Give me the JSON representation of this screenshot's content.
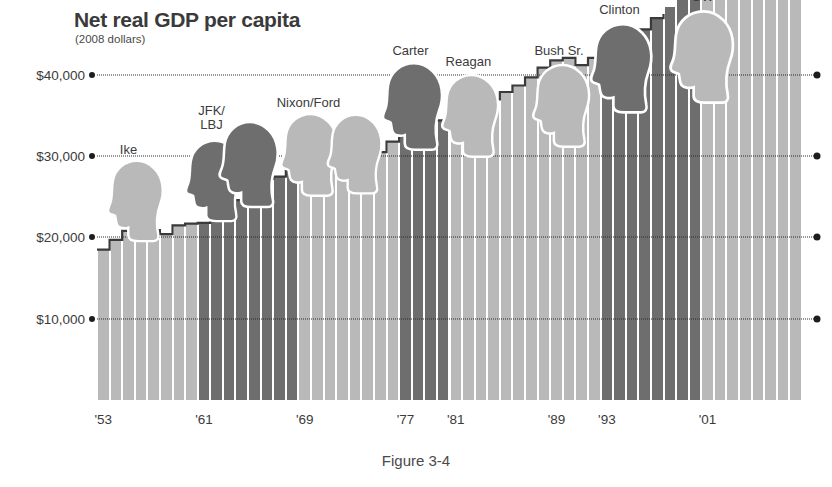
{
  "figure": {
    "caption": "Figure 3-4"
  },
  "header": {
    "title": "Net real GDP per capita",
    "subtitle": "(2008 dollars)"
  },
  "colors": {
    "bar_light": "#b9b9b9",
    "bar_dark": "#6e6e6e",
    "outline": "#3a3a3a",
    "text": "#3b3b3b",
    "grid": "#2a2a2a",
    "background": "#ffffff"
  },
  "chart_data": {
    "type": "bar",
    "title": "Net real GDP per capita",
    "subtitle": "(2008 dollars)",
    "xlabel": "",
    "ylabel": "",
    "ylim": [
      0,
      47500
    ],
    "grid": true,
    "legend": "none",
    "y_ticks": [
      10000,
      20000,
      30000,
      40000
    ],
    "y_tick_labels": [
      "$10,000",
      "$20,000",
      "$30,000",
      "$40,000"
    ],
    "x_tick_years": [
      1953,
      1961,
      1969,
      1977,
      1981,
      1989,
      1993,
      2001
    ],
    "x_tick_labels": [
      "'53",
      "'61",
      "'69",
      "'77",
      "'81",
      "'89",
      "'93",
      "'01"
    ],
    "x": [
      1953,
      1954,
      1955,
      1956,
      1957,
      1958,
      1959,
      1960,
      1961,
      1962,
      1963,
      1964,
      1965,
      1966,
      1967,
      1968,
      1969,
      1970,
      1971,
      1972,
      1973,
      1974,
      1975,
      1976,
      1977,
      1978,
      1979,
      1980,
      1981,
      1982,
      1983,
      1984,
      1985,
      1986,
      1987,
      1988,
      1989,
      1990,
      1991,
      1992,
      1993,
      1994,
      1995,
      1996,
      1997,
      1998,
      1999,
      2000,
      2001,
      2002,
      2003,
      2004,
      2005,
      2006,
      2007,
      2008
    ],
    "values": [
      18500,
      19700,
      20800,
      20900,
      20900,
      20400,
      21500,
      21700,
      21800,
      22800,
      23500,
      24600,
      25900,
      27200,
      27500,
      28500,
      29100,
      28700,
      29200,
      30400,
      31700,
      31100,
      30500,
      31800,
      32900,
      34400,
      35000,
      34400,
      34900,
      33700,
      34900,
      37000,
      37900,
      38700,
      39700,
      40900,
      41800,
      42100,
      41200,
      42100,
      42800,
      44000,
      44500,
      45600,
      47000,
      48400,
      50100,
      51500,
      51300,
      51500,
      52600,
      54200,
      55600,
      56600,
      57000,
      50200
    ],
    "presidents": [
      {
        "label": "Ike",
        "start_year": 1953,
        "end_year": 1960,
        "party": "republican",
        "shade": "light"
      },
      {
        "label": "JFK/\nLBJ",
        "start_year": 1961,
        "end_year": 1968,
        "party": "democrat",
        "shade": "dark"
      },
      {
        "label": "Nixon/Ford",
        "start_year": 1969,
        "end_year": 1976,
        "party": "republican",
        "shade": "light"
      },
      {
        "label": "Carter",
        "start_year": 1977,
        "end_year": 1980,
        "party": "democrat",
        "shade": "dark"
      },
      {
        "label": "Reagan",
        "start_year": 1981,
        "end_year": 1988,
        "party": "republican",
        "shade": "light"
      },
      {
        "label": "Bush Sr.",
        "start_year": 1989,
        "end_year": 1992,
        "party": "republican",
        "shade": "light"
      },
      {
        "label": "Clinton",
        "start_year": 1993,
        "end_year": 2000,
        "party": "democrat",
        "shade": "dark"
      },
      {
        "label": "GW",
        "start_year": 2001,
        "end_year": 2008,
        "party": "republican",
        "shade": "light"
      }
    ],
    "silhouettes": [
      {
        "name": "ike-silhouette",
        "shade": "light",
        "x_year": 1955.6,
        "top_value": 29800,
        "scale": 1.0
      },
      {
        "name": "jfk-silhouette",
        "shade": "dark",
        "x_year": 1961.8,
        "top_value": 32200,
        "scale": 1.0
      },
      {
        "name": "lbj-silhouette",
        "shade": "dark",
        "x_year": 1964.6,
        "top_value": 34600,
        "scale": 1.06
      },
      {
        "name": "nixon-silhouette",
        "shade": "light",
        "x_year": 1969.4,
        "top_value": 35600,
        "scale": 1.02
      },
      {
        "name": "ford-silhouette",
        "shade": "light",
        "x_year": 1973.0,
        "top_value": 35400,
        "scale": 0.98
      },
      {
        "name": "carter-silhouette",
        "shade": "dark",
        "x_year": 1977.6,
        "top_value": 41800,
        "scale": 1.08
      },
      {
        "name": "reagan-silhouette",
        "shade": "light",
        "x_year": 1982.2,
        "top_value": 40400,
        "scale": 1.02
      },
      {
        "name": "bush-sr-silhouette",
        "shade": "light",
        "x_year": 1989.4,
        "top_value": 41600,
        "scale": 1.02
      },
      {
        "name": "clinton-silhouette",
        "shade": "dark",
        "x_year": 1994.2,
        "top_value": 46600,
        "scale": 1.1
      },
      {
        "name": "gw-silhouette",
        "shade": "light",
        "x_year": 2000.6,
        "top_value": 48200,
        "scale": 1.14
      }
    ],
    "president_label_positions": [
      {
        "label_key": 0,
        "x_year": 1955.0,
        "top_value": 31600
      },
      {
        "label_key": 1,
        "x_year": 1961.6,
        "top_value": 36400
      },
      {
        "label_key": 2,
        "x_year": 1969.3,
        "top_value": 37400
      },
      {
        "label_key": 3,
        "x_year": 1977.4,
        "top_value": 43800
      },
      {
        "label_key": 4,
        "x_year": 1982.0,
        "top_value": 42400
      },
      {
        "label_key": 5,
        "x_year": 1989.2,
        "top_value": 43800
      },
      {
        "label_key": 6,
        "x_year": 1994.0,
        "top_value": 48800
      },
      {
        "label_key": 7,
        "x_year": 2000.6,
        "top_value": 50400
      }
    ]
  }
}
